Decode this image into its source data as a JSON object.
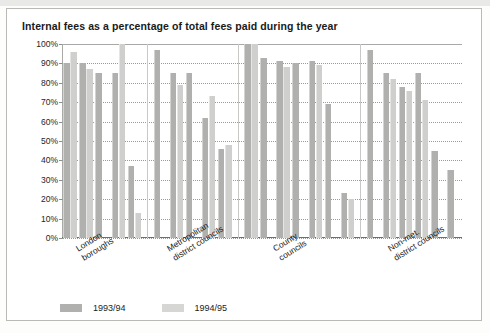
{
  "chart_data": {
    "type": "bar",
    "title": "Internal fees as a percentage of total fees paid during the year",
    "xlabel": "",
    "ylabel": "",
    "ylim": [
      0,
      100
    ],
    "ytick_labels": [
      "100%",
      "90%",
      "80%",
      "70%",
      "60%",
      "50%",
      "40%",
      "30%",
      "20%",
      "10%",
      "0%"
    ],
    "ytick_values": [
      100,
      90,
      80,
      70,
      60,
      50,
      40,
      30,
      20,
      10,
      0
    ],
    "grid": true,
    "legend_position": "bottom-left",
    "categories": [
      "London\nboroughs",
      "Metropolitan\ndistrict councils",
      "County\ncouncils",
      "Non-met.\ndistrict councils"
    ],
    "groups": [
      {
        "label": "London boroughs",
        "pairs": [
          {
            "1993/94": 90,
            "1994/95": 96
          },
          {
            "1993/94": 90,
            "1994/95": 87
          },
          {
            "1993/94": 85,
            "1994/95": 0
          },
          {
            "1993/94": 85,
            "1994/95": 100
          },
          {
            "1993/94": 37,
            "1994/95": 13
          }
        ]
      },
      {
        "label": "Metropolitan district councils",
        "pairs": [
          {
            "1993/94": 97,
            "1994/95": 0
          },
          {
            "1993/94": 85,
            "1994/95": 79
          },
          {
            "1993/94": 85,
            "1994/95": 0
          },
          {
            "1993/94": 62,
            "1994/95": 73
          },
          {
            "1993/94": 46,
            "1994/95": 48
          }
        ]
      },
      {
        "label": "County councils",
        "pairs": [
          {
            "1993/94": 100,
            "1994/95": 100
          },
          {
            "1993/94": 93,
            "1994/95": 0
          },
          {
            "1993/94": 91,
            "1994/95": 88
          },
          {
            "1993/94": 90,
            "1994/95": 0
          },
          {
            "1993/94": 91,
            "1994/95": 89
          },
          {
            "1993/94": 69,
            "1994/95": 0
          },
          {
            "1993/94": 23,
            "1994/95": 20
          }
        ]
      },
      {
        "label": "Non-met. district councils",
        "pairs": [
          {
            "1993/94": 97,
            "1994/95": 0
          },
          {
            "1993/94": 85,
            "1994/95": 82
          },
          {
            "1993/94": 78,
            "1994/95": 76
          },
          {
            "1993/94": 85,
            "1994/95": 71
          },
          {
            "1993/94": 45,
            "1994/95": 0
          },
          {
            "1993/94": 35,
            "1994/95": 0
          }
        ]
      }
    ],
    "series": [
      {
        "name": "1993/94",
        "color": "#b0b0ae"
      },
      {
        "name": "1994/95",
        "color": "#d6d6d4"
      }
    ]
  },
  "legend": {
    "items": [
      {
        "label": "1993/94",
        "key": "s0"
      },
      {
        "label": "1994/95",
        "key": "s1"
      }
    ]
  },
  "colors": {
    "series_1993_94": "#b0b0ae",
    "series_1994_95": "#d6d6d4",
    "grid": "#9a9a98",
    "axis": "#6f6f6d",
    "text": "#1b1b1b",
    "frame": "#b9b9b6",
    "background": "#ffffff"
  }
}
